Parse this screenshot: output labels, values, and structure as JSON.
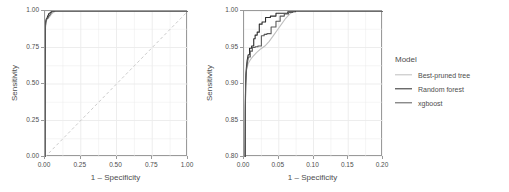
{
  "chart_data": {
    "type": "line",
    "title": "",
    "panels": [
      {
        "name": "full-roc",
        "xlabel": "1 – Specificity",
        "ylabel": "Sensitivity",
        "xlim": [
          0.0,
          1.0
        ],
        "ylim": [
          0.0,
          1.0
        ],
        "xticks": [
          "0.00",
          "0.25",
          "0.50",
          "0.75",
          "1.00"
        ],
        "xtickvals": [
          0.0,
          0.25,
          0.5,
          0.75,
          1.0
        ],
        "yticks": [
          "0.00",
          "0.25",
          "0.50",
          "0.75",
          "1.00"
        ],
        "ytickvals": [
          0.0,
          0.25,
          0.5,
          0.75,
          1.0
        ],
        "grid": true,
        "diagonal_reference": true,
        "series": [
          {
            "name": "Best-pruned tree",
            "color": "#bfbfbf",
            "x": [
              0.0,
              0.001,
              0.002,
              0.003,
              0.004,
              0.006,
              0.009,
              0.013,
              0.02,
              0.03,
              0.045,
              0.06,
              0.075,
              0.1,
              0.15,
              0.2,
              0.3,
              0.45,
              0.6,
              0.8,
              1.0
            ],
            "y": [
              0.0,
              0.62,
              0.78,
              0.86,
              0.9,
              0.921,
              0.932,
              0.94,
              0.948,
              0.958,
              0.978,
              0.992,
              1.0,
              1.0,
              1.0,
              1.0,
              1.0,
              1.0,
              1.0,
              1.0,
              1.0
            ]
          },
          {
            "name": "Random forest",
            "color": "#2b2b2b",
            "x": [
              0.0,
              0.001,
              0.002,
              0.003,
              0.005,
              0.008,
              0.011,
              0.015,
              0.019,
              0.023,
              0.027,
              0.032,
              0.04,
              0.05,
              0.058,
              0.065,
              0.073,
              0.09,
              0.12,
              0.2,
              0.4,
              0.7,
              1.0
            ],
            "y": [
              0.0,
              0.66,
              0.82,
              0.9,
              0.925,
              0.941,
              0.949,
              0.952,
              0.967,
              0.971,
              0.983,
              0.985,
              0.992,
              0.997,
              0.997,
              0.999,
              1.0,
              1.0,
              1.0,
              1.0,
              1.0,
              1.0,
              1.0
            ]
          },
          {
            "name": "xgboost",
            "color": "#595959",
            "x": [
              0.0,
              0.001,
              0.002,
              0.003,
              0.005,
              0.008,
              0.012,
              0.016,
              0.021,
              0.026,
              0.031,
              0.037,
              0.044,
              0.05,
              0.056,
              0.062,
              0.07,
              0.085,
              0.12,
              0.2,
              0.4,
              0.7,
              1.0
            ],
            "y": [
              0.0,
              0.64,
              0.8,
              0.888,
              0.918,
              0.936,
              0.945,
              0.951,
              0.952,
              0.967,
              0.968,
              0.978,
              0.988,
              0.995,
              0.997,
              0.998,
              1.0,
              1.0,
              1.0,
              1.0,
              1.0,
              1.0,
              1.0
            ]
          }
        ]
      },
      {
        "name": "zoomed-roc",
        "xlabel": "1 – Specificity",
        "ylabel": "Sensitivity",
        "xlim": [
          0.0,
          0.2
        ],
        "ylim": [
          0.8,
          1.0
        ],
        "xticks": [
          "0.00",
          "0.05",
          "0.10",
          "0.15",
          "0.20"
        ],
        "xtickvals": [
          0.0,
          0.05,
          0.1,
          0.15,
          0.2
        ],
        "yticks": [
          "0.80",
          "0.85",
          "0.90",
          "0.95",
          "1.00"
        ],
        "ytickvals": [
          0.8,
          0.85,
          0.9,
          0.95,
          1.0
        ],
        "grid": true,
        "diagonal_reference": false,
        "series": [
          {
            "name": "Best-pruned tree",
            "color": "#bfbfbf",
            "x": [
              0.0015,
              0.0018,
              0.0022,
              0.0026,
              0.003,
              0.004,
              0.006,
              0.009,
              0.013,
              0.018,
              0.024,
              0.03,
              0.036,
              0.042,
              0.048,
              0.054,
              0.06,
              0.066,
              0.072,
              0.08,
              0.1,
              0.13,
              0.16,
              0.2
            ],
            "y": [
              0.8,
              0.86,
              0.89,
              0.905,
              0.915,
              0.921,
              0.928,
              0.933,
              0.938,
              0.943,
              0.948,
              0.952,
              0.958,
              0.966,
              0.974,
              0.982,
              0.99,
              0.996,
              1.0,
              1.0,
              1.0,
              1.0,
              1.0,
              1.0
            ]
          },
          {
            "name": "Random forest",
            "color": "#2b2b2b",
            "x": [
              0.0018,
              0.002,
              0.0024,
              0.0028,
              0.0034,
              0.0045,
              0.006,
              0.008,
              0.008,
              0.011,
              0.011,
              0.014,
              0.014,
              0.016,
              0.016,
              0.019,
              0.019,
              0.022,
              0.022,
              0.026,
              0.026,
              0.031,
              0.031,
              0.038,
              0.038,
              0.046,
              0.046,
              0.054,
              0.054,
              0.063,
              0.063,
              0.068,
              0.068,
              0.074,
              0.074,
              0.09,
              0.12,
              0.16,
              0.2
            ],
            "y": [
              0.8,
              0.87,
              0.9,
              0.912,
              0.922,
              0.932,
              0.94,
              0.94,
              0.949,
              0.949,
              0.952,
              0.952,
              0.962,
              0.962,
              0.967,
              0.967,
              0.971,
              0.971,
              0.982,
              0.982,
              0.985,
              0.985,
              0.991,
              0.991,
              0.993,
              0.993,
              0.997,
              0.997,
              0.997,
              0.997,
              0.999,
              0.999,
              0.999,
              0.999,
              1.0,
              1.0,
              1.0,
              1.0,
              1.0
            ]
          },
          {
            "name": "xgboost",
            "color": "#595959",
            "x": [
              0.0016,
              0.0019,
              0.0023,
              0.0028,
              0.0035,
              0.0048,
              0.0065,
              0.009,
              0.009,
              0.012,
              0.012,
              0.016,
              0.016,
              0.02,
              0.02,
              0.025,
              0.025,
              0.029,
              0.029,
              0.033,
              0.033,
              0.039,
              0.039,
              0.046,
              0.046,
              0.052,
              0.052,
              0.058,
              0.058,
              0.064,
              0.064,
              0.07,
              0.07,
              0.085,
              0.11,
              0.15,
              0.2
            ],
            "y": [
              0.8,
              0.865,
              0.897,
              0.909,
              0.919,
              0.929,
              0.937,
              0.937,
              0.945,
              0.945,
              0.95,
              0.95,
              0.951,
              0.951,
              0.952,
              0.952,
              0.966,
              0.966,
              0.968,
              0.968,
              0.969,
              0.969,
              0.978,
              0.978,
              0.986,
              0.986,
              0.993,
              0.993,
              0.996,
              0.996,
              0.998,
              0.998,
              1.0,
              1.0,
              1.0,
              1.0,
              1.0
            ]
          }
        ]
      }
    ],
    "legend": {
      "title": "Model",
      "position": "right",
      "entries": [
        {
          "label": "Best-pruned tree",
          "color": "#bfbfbf"
        },
        {
          "label": "Random forest",
          "color": "#2b2b2b"
        },
        {
          "label": "xgboost",
          "color": "#595959"
        }
      ]
    },
    "style": {
      "panel_background": "#ffffff",
      "panel_border": "#9a9a9a",
      "grid_color": "#ebebeb",
      "text_color": "#4d4d4d",
      "reference_line_color": "#cccccc"
    }
  }
}
